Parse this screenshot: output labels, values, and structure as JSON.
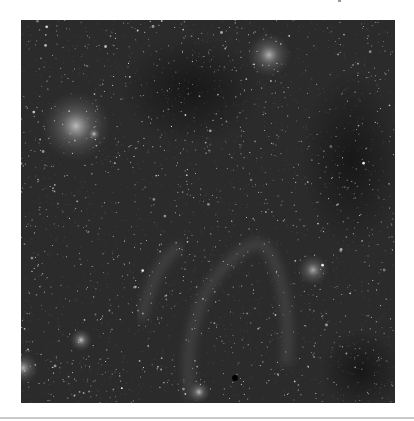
{
  "image": {
    "subject": "grayscale astronomical sky survey field",
    "description": "dense star field with diffuse nebulosity and dark dust lanes",
    "frame": {
      "x": 21,
      "y": 20,
      "width": 374,
      "height": 383
    },
    "colors": {
      "page_background": "#ffffff",
      "sky_base": "#2b2b2b",
      "dark_lane": "#161616",
      "nebula_glow": "#bdbdbd",
      "star": "#f2f2f2",
      "separator": "#c9c9c9"
    },
    "features": [
      {
        "name": "bright-nebula-upper-left",
        "cx": 55,
        "cy": 106,
        "r": 22,
        "intensity": 0.55
      },
      {
        "name": "nebula-upper-right",
        "cx": 248,
        "cy": 35,
        "r": 14,
        "intensity": 0.5
      },
      {
        "name": "galaxy-right",
        "cx": 292,
        "cy": 250,
        "r": 10,
        "intensity": 0.45
      },
      {
        "name": "bright-star-lower-left",
        "cx": 60,
        "cy": 320,
        "r": 7,
        "intensity": 0.6
      },
      {
        "name": "bright-star-left-edge",
        "cx": 2,
        "cy": 348,
        "r": 10,
        "intensity": 0.5
      },
      {
        "name": "bright-star-bottom",
        "cx": 178,
        "cy": 372,
        "r": 7,
        "intensity": 0.55
      },
      {
        "name": "star-left-mid",
        "cx": 73,
        "cy": 114,
        "r": 4,
        "intensity": 0.6
      }
    ],
    "dark_regions": [
      {
        "name": "dark-lane-upper-center",
        "cx": 170,
        "cy": 70,
        "rx": 70,
        "ry": 55
      },
      {
        "name": "dark-region-right",
        "cx": 330,
        "cy": 140,
        "rx": 50,
        "ry": 90
      },
      {
        "name": "dark-region-lower-right",
        "cx": 340,
        "cy": 350,
        "rx": 40,
        "ry": 40
      }
    ],
    "filaments": [
      {
        "name": "filament-loop-center",
        "path": "M170 380 C 160 320, 180 270, 205 245 C 225 225, 240 215, 250 235 C 262 260, 270 300, 265 345"
      },
      {
        "name": "filament-left",
        "path": "M120 300 C 130 260, 140 240, 160 225"
      }
    ],
    "dark_spot": {
      "cx": 214,
      "cy": 358,
      "r": 3
    },
    "star_seed": 7,
    "star_count": 1300
  },
  "page": {
    "separator_y": 417
  }
}
